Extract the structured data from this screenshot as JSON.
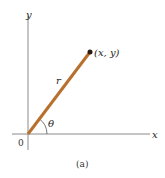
{
  "figure": {
    "caption": "(a)",
    "axis_x_label": "x",
    "axis_y_label": "y",
    "origin_label": "0",
    "point_label": "(x, y)",
    "radius_label": "r",
    "angle_label": "θ",
    "colors": {
      "radius_line": "#b8702e",
      "axes": "#8a8a8a",
      "point": "#2a1a10"
    }
  }
}
